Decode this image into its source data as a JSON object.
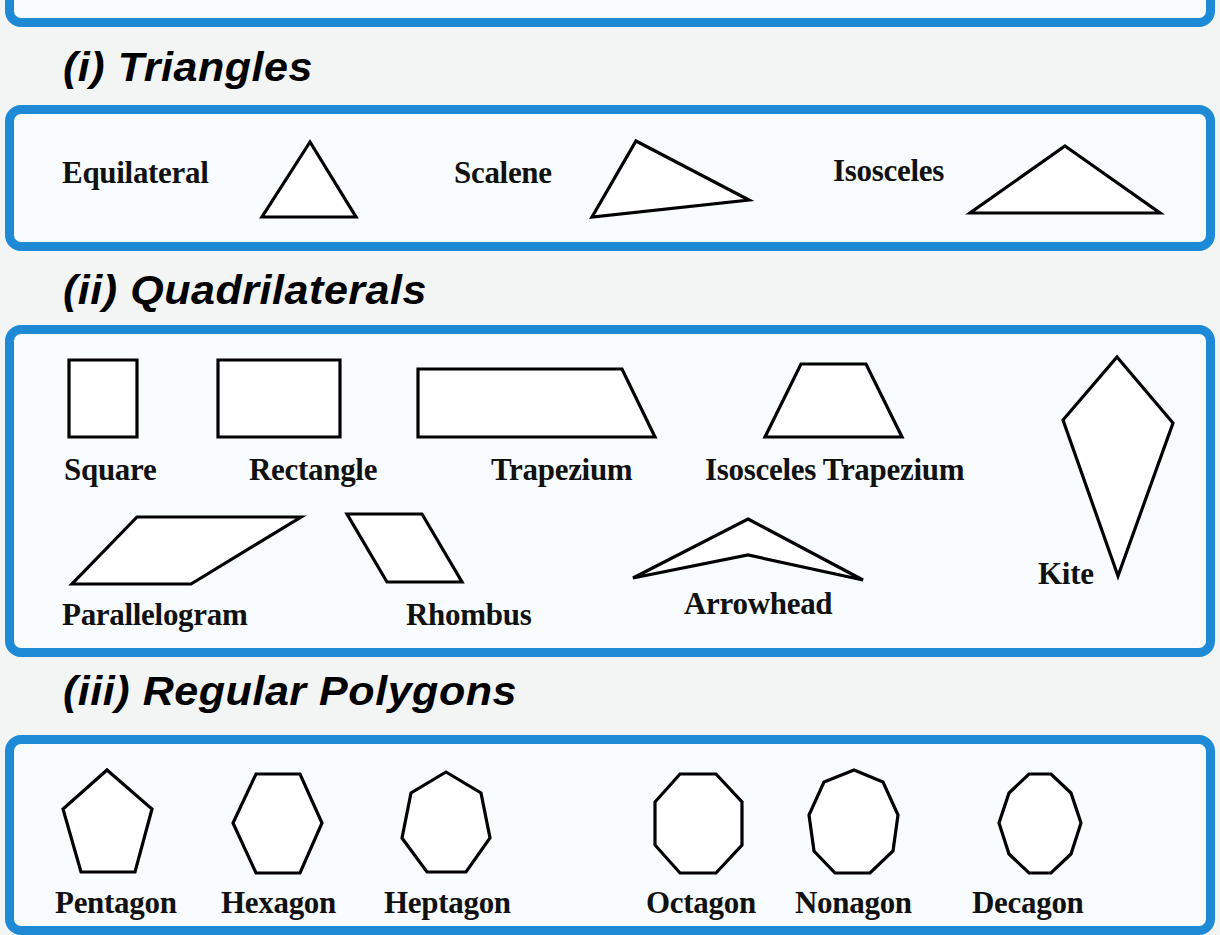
{
  "top_box": {
    "visible_title_fragment": ""
  },
  "sections": {
    "triangles": {
      "heading": "(i) Triangles",
      "items": [
        {
          "label": "Equilateral"
        },
        {
          "label": "Scalene"
        },
        {
          "label": "Isosceles"
        }
      ]
    },
    "quadrilaterals": {
      "heading": "(ii) Quadrilaterals",
      "items": [
        {
          "label": "Square"
        },
        {
          "label": "Rectangle"
        },
        {
          "label": "Trapezium"
        },
        {
          "label": "Isosceles Trapezium"
        },
        {
          "label": "Kite"
        },
        {
          "label": "Parallelogram"
        },
        {
          "label": "Rhombus"
        },
        {
          "label": "Arrowhead"
        }
      ]
    },
    "regular_polygons": {
      "heading": "(iii) Regular Polygons",
      "items": [
        {
          "label": "Pentagon"
        },
        {
          "label": "Hexagon"
        },
        {
          "label": "Heptagon"
        },
        {
          "label": "Octagon"
        },
        {
          "label": "Nonagon"
        },
        {
          "label": "Decagon"
        }
      ]
    }
  },
  "colors": {
    "box_border": "#1e8ad6",
    "box_fill": "#f9fcfd",
    "page_background": "#f3f4f4",
    "shape_stroke": "#000000",
    "shape_fill": "#ffffff"
  }
}
